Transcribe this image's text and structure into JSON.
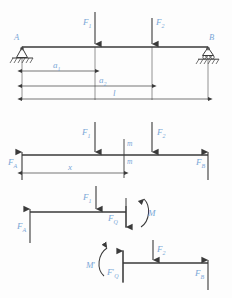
{
  "figure": {
    "type": "engineering-mechanics-diagram",
    "line_color": "#3a3a3a",
    "label_color": "#7ba7d7",
    "background_color": "#fdfdfd"
  },
  "diagram1": {
    "name": "beam-with-supports",
    "support_left_label": "A",
    "support_right_label": "B",
    "support_left_type": "pinned-support",
    "support_right_type": "roller-support",
    "load1_label": "F",
    "load1_sub": "1",
    "load2_label": "F",
    "load2_sub": "2",
    "dim_a1_label": "a",
    "dim_a1_sub": "1",
    "dim_a2_label": "a",
    "dim_a2_sub": "2",
    "dim_l_label": "l"
  },
  "diagram2": {
    "name": "free-body-diagram",
    "reaction_left_label": "F",
    "reaction_left_sub": "A",
    "reaction_right_label": "F",
    "reaction_right_sub": "B",
    "load1_label": "F",
    "load1_sub": "1",
    "load2_label": "F",
    "load2_sub": "2",
    "section_top_label": "m",
    "section_bottom_label": "m",
    "dim_x_label": "x"
  },
  "diagram3": {
    "name": "left-segment-fbd",
    "reaction_label": "F",
    "reaction_sub": "A",
    "load_label": "F",
    "load_sub": "1",
    "shear_label": "F",
    "shear_sub": "Q",
    "moment_label": "M"
  },
  "diagram4": {
    "name": "right-segment-fbd",
    "moment_label": "M",
    "moment_prime": "′",
    "shear_label": "F",
    "shear_sub": "Q",
    "shear_prime": "′",
    "load_label": "F",
    "load_sub": "2",
    "reaction_label": "F",
    "reaction_sub": "B"
  }
}
